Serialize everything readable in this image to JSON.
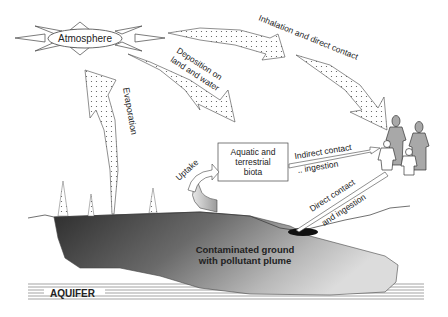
{
  "diagram": {
    "atmosphere": {
      "label": "Atmosphere"
    },
    "pathways": {
      "evaporation": "Evaporation",
      "deposition_line1": "Deposition on",
      "deposition_line2": "land and water",
      "inhalation": "Inhalation and direct contact",
      "uptake": "Uptake",
      "indirect_line1": "Indirect contact",
      "indirect_line2": ".. ingestion",
      "direct_line1": "Direct contact",
      "direct_line2": "and ingestion"
    },
    "biota_box": {
      "line1": "Aquatic and",
      "line2": "terrestrial",
      "line3": "biota"
    },
    "ground": {
      "line1": "Contaminated ground",
      "line2": "with pollutant plume"
    },
    "aquifer": {
      "label": "AQUIFER"
    },
    "receptors": {
      "icon": "family-people-icon",
      "count": 4
    },
    "colors": {
      "ground_dark": "#3a3a3a",
      "plume_light": "#d0d0d0",
      "arrow_fill": "#ffffff",
      "people_adult": "#a8a8a8",
      "people_child": "#ffffff",
      "stroke": "#333333"
    }
  }
}
